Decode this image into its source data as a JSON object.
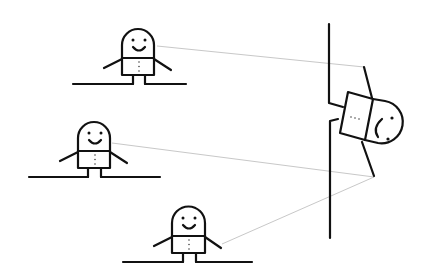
{
  "diagram": {
    "colors": {
      "ink": "#111111",
      "sight_line": "#c8c8c8",
      "background": "#ffffff"
    },
    "figures": [
      {
        "id": "figure-top",
        "expression": "smile",
        "head_x": 138,
        "head_top": 30,
        "ground_y": 84,
        "ground_x1": 73,
        "ground_x2": 186
      },
      {
        "id": "figure-middle",
        "expression": "smile",
        "head_x": 94,
        "head_top": 122,
        "ground_y": 177,
        "ground_x1": 29,
        "ground_x2": 160
      },
      {
        "id": "figure-bottom",
        "expression": "smile",
        "head_x": 188,
        "head_top": 207,
        "ground_y": 262,
        "ground_x1": 123,
        "ground_x2": 252
      }
    ],
    "wall": {
      "x": 329,
      "y_top": 24,
      "y_bottom": 238
    },
    "peeking_figure": {
      "expression": "frown",
      "orientation": "rotated-sideways"
    },
    "sight_lines": [
      {
        "from": "figure-top",
        "to": "peeking-figure-upper-arm"
      },
      {
        "from": "figure-middle",
        "to": "peeking-figure-lower-arm"
      },
      {
        "from": "figure-bottom",
        "to": "peeking-figure-lower-arm"
      }
    ]
  }
}
